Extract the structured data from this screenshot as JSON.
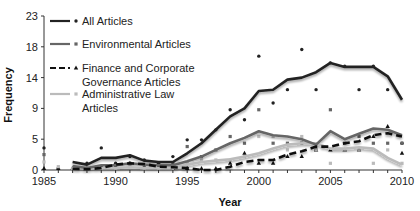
{
  "chart_data": {
    "type": "line",
    "title": "",
    "xlabel": "Year",
    "ylabel": "Frequency",
    "xlim": [
      1985,
      2010
    ],
    "ylim": [
      0,
      23
    ],
    "x_ticks": [
      1985,
      1990,
      1995,
      2000,
      2005,
      2010
    ],
    "y_ticks": [
      0,
      5,
      9,
      14,
      18,
      23
    ],
    "y_tick_positions": [
      0,
      4.6,
      9.2,
      13.8,
      18.4,
      23
    ],
    "grid": false,
    "legend_position": "upper-left",
    "x": [
      1985,
      1986,
      1987,
      1988,
      1989,
      1990,
      1991,
      1992,
      1993,
      1994,
      1995,
      1996,
      1997,
      1998,
      1999,
      2000,
      2001,
      2002,
      2003,
      2004,
      2005,
      2006,
      2007,
      2008,
      2009,
      2010
    ],
    "series": [
      {
        "name": "All Articles",
        "style": "solid",
        "color": "#222222",
        "marker": "diamond",
        "trend": [
          null,
          null,
          1.2,
          0.8,
          1.8,
          1.8,
          2.2,
          1.4,
          1.2,
          1.2,
          2.5,
          4.0,
          6.0,
          8.0,
          9.2,
          11.8,
          12.0,
          13.5,
          13.8,
          14.6,
          16.0,
          15.4,
          15.4,
          15.4,
          14.0,
          10.5
        ],
        "points": [
          3.3,
          0,
          0,
          1,
          3.3,
          1,
          2,
          1.5,
          1,
          2,
          4.5,
          4.5,
          6,
          9,
          7.5,
          17,
          10,
          12,
          18,
          12,
          16,
          15.5,
          12,
          15.5,
          12,
          4
        ]
      },
      {
        "name": "Environmental Articles",
        "style": "solid",
        "color": "#666666",
        "marker": "square",
        "trend": [
          null,
          null,
          0.6,
          0.3,
          0.7,
          0.7,
          1.0,
          0.8,
          0.7,
          0.7,
          1.3,
          2.0,
          3.0,
          4.0,
          4.8,
          5.8,
          5.2,
          5.0,
          4.6,
          3.8,
          5.8,
          4.6,
          5.4,
          6.2,
          6.0,
          5.2
        ],
        "points": [
          2.3,
          0,
          0,
          0,
          0.5,
          0.5,
          1,
          0.5,
          0.5,
          1,
          3.5,
          2,
          3,
          5,
          4,
          9,
          4,
          4,
          4,
          3,
          9,
          4,
          5,
          4,
          4,
          4
        ]
      },
      {
        "name": "Finance and Corporate Governance Articles",
        "style": "dashed",
        "color": "#111111",
        "marker": "triangle",
        "trend": [
          null,
          null,
          0.2,
          0.1,
          0.3,
          0.8,
          1.0,
          0.9,
          0.5,
          0.4,
          0.3,
          0.0,
          0.0,
          0.5,
          1.2,
          1.5,
          1.5,
          2.3,
          2.8,
          3.5,
          3.5,
          4.0,
          4.3,
          5.2,
          5.5,
          5.0
        ],
        "points": [
          0,
          0,
          0,
          0,
          0.5,
          0.5,
          1,
          0.5,
          0.5,
          0,
          0,
          0,
          0,
          1,
          2.5,
          1,
          1,
          2,
          2,
          3,
          3,
          3,
          3,
          5,
          6.5,
          2.5
        ]
      },
      {
        "name": "Administrative Law Articles",
        "style": "solid",
        "color": "#bbbbbb",
        "marker": "square",
        "trend": [
          null,
          null,
          0.4,
          0.2,
          0.3,
          0.3,
          0.4,
          0.3,
          0.3,
          0.3,
          0.8,
          1.2,
          1.4,
          1.6,
          2.0,
          2.5,
          3.2,
          3.8,
          4.0,
          4.0,
          3.2,
          3.2,
          3.4,
          3.2,
          1.8,
          0.8
        ],
        "points": [
          1.2,
          0.5,
          0,
          0,
          0,
          0,
          0.5,
          0,
          0,
          0,
          1,
          1.5,
          1.5,
          1.5,
          2,
          5,
          5,
          3,
          5,
          3,
          1,
          3,
          3,
          1,
          3,
          1
        ]
      }
    ]
  },
  "legend": {
    "items": [
      {
        "label_lines": [
          "All Articles"
        ]
      },
      {
        "label_lines": [
          "Environmental Articles"
        ]
      },
      {
        "label_lines": [
          "Finance and Corporate",
          "Governance Articles"
        ]
      },
      {
        "label_lines": [
          "Administrative Law",
          "Articles"
        ]
      }
    ]
  },
  "axes": {
    "x_title": "Year",
    "y_title": "Frequency"
  }
}
